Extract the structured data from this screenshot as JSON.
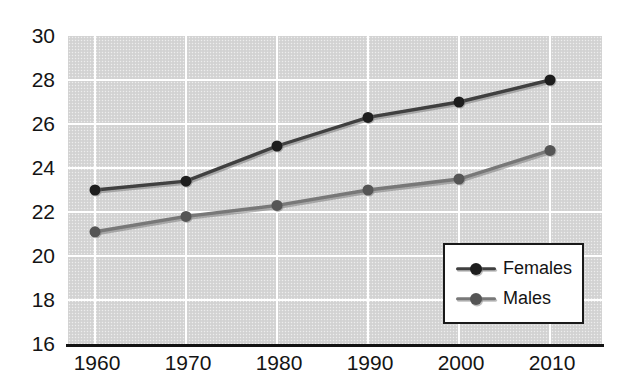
{
  "chart_data": {
    "type": "line",
    "title": "",
    "xlabel": "",
    "ylabel": "",
    "categories": [
      "1960",
      "1970",
      "1980",
      "1990",
      "2000",
      "2010"
    ],
    "series": [
      {
        "name": "Females",
        "values": [
          23.0,
          23.4,
          25.0,
          26.3,
          27.0,
          28.0
        ],
        "line_color": "#404040",
        "marker_color": "#1e1e1e"
      },
      {
        "name": "Males",
        "values": [
          21.1,
          21.8,
          22.3,
          23.0,
          23.5,
          24.8
        ],
        "line_color": "#787878",
        "marker_color": "#555555"
      }
    ],
    "ylim": [
      16,
      30
    ],
    "y_ticks": [
      16,
      18,
      20,
      22,
      24,
      26,
      28,
      30
    ],
    "grid": true,
    "legend_position": "lower-right",
    "plot_bg_color": "#d6d6d6",
    "gridline_color": "#ffffff",
    "axis_color": "#141414",
    "label_color": "#141414",
    "legend_bg_color": "#ffffff",
    "legend_border_color": "#1a1a1a"
  }
}
